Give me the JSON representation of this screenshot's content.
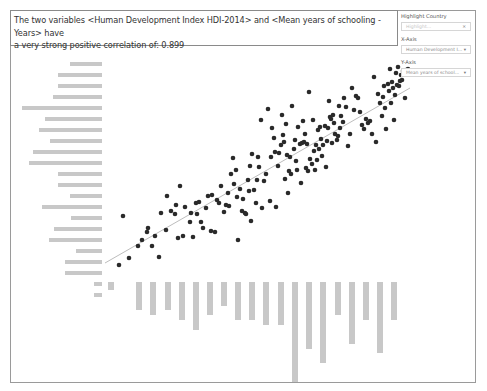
{
  "title": {
    "line1": "The two variables <Human Development Index HDI-2014> and <Mean years of schooling - Years> have",
    "line2": "a very strong positive correlation of: 0.899"
  },
  "controls": {
    "highlight": {
      "label": "Highlight Country",
      "placeholder": "Highlight..."
    },
    "x_axis": {
      "label": "X-Axis",
      "value": "Human Development I...",
      "arrow": "▾"
    },
    "y_axis": {
      "label": "Y-Axis",
      "value": "Mean years of school...",
      "arrow": "▾"
    }
  },
  "colors": {
    "dot": "#2a2a2a",
    "trend": "#bdbdbd",
    "hist": "#c8c8c8",
    "frame": "#9a9a9a"
  },
  "chart_data": {
    "type": "scatter",
    "title": "The two variables <Human Development Index HDI-2014> and <Mean years of schooling - Years> have a very strong positive correlation of: 0.899",
    "xlabel": "Human Development Index HDI-2014",
    "ylabel": "Mean years of schooling - Years",
    "correlation": 0.899,
    "grid": false,
    "trend_line": {
      "x1": 105,
      "y1": 263,
      "x2": 410,
      "y2": 88
    },
    "points_px": [
      [
        119,
        265
      ],
      [
        123,
        216
      ],
      [
        129,
        258
      ],
      [
        138,
        246
      ],
      [
        142,
        240
      ],
      [
        147,
        232
      ],
      [
        148,
        228
      ],
      [
        152,
        246
      ],
      [
        155,
        236
      ],
      [
        159,
        257
      ],
      [
        161,
        213
      ],
      [
        166,
        230
      ],
      [
        167,
        196
      ],
      [
        171,
        211
      ],
      [
        175,
        214
      ],
      [
        176,
        205
      ],
      [
        178,
        238
      ],
      [
        180,
        186
      ],
      [
        183,
        236
      ],
      [
        185,
        207
      ],
      [
        190,
        222
      ],
      [
        191,
        213
      ],
      [
        193,
        237
      ],
      [
        196,
        203
      ],
      [
        197,
        214
      ],
      [
        199,
        202
      ],
      [
        201,
        222
      ],
      [
        203,
        228
      ],
      [
        206,
        208
      ],
      [
        208,
        196
      ],
      [
        211,
        231
      ],
      [
        212,
        195
      ],
      [
        215,
        232
      ],
      [
        217,
        200
      ],
      [
        219,
        203
      ],
      [
        221,
        186
      ],
      [
        224,
        212
      ],
      [
        226,
        205
      ],
      [
        228,
        193
      ],
      [
        229,
        206
      ],
      [
        231,
        174
      ],
      [
        233,
        158
      ],
      [
        234,
        184
      ],
      [
        236,
        170
      ],
      [
        237,
        197
      ],
      [
        238,
        240
      ],
      [
        240,
        189
      ],
      [
        242,
        211
      ],
      [
        243,
        199
      ],
      [
        245,
        213
      ],
      [
        246,
        214
      ],
      [
        248,
        180
      ],
      [
        249,
        191
      ],
      [
        250,
        166
      ],
      [
        251,
        221
      ],
      [
        252,
        154
      ],
      [
        254,
        190
      ],
      [
        256,
        203
      ],
      [
        257,
        180
      ],
      [
        258,
        157
      ],
      [
        259,
        167
      ],
      [
        261,
        120
      ],
      [
        262,
        208
      ],
      [
        264,
        181
      ],
      [
        266,
        174
      ],
      [
        268,
        109
      ],
      [
        270,
        201
      ],
      [
        271,
        157
      ],
      [
        272,
        128
      ],
      [
        274,
        138
      ],
      [
        275,
        152
      ],
      [
        276,
        207
      ],
      [
        278,
        166
      ],
      [
        279,
        153
      ],
      [
        281,
        145
      ],
      [
        282,
        115
      ],
      [
        283,
        135
      ],
      [
        284,
        142
      ],
      [
        285,
        179
      ],
      [
        286,
        124
      ],
      [
        287,
        155
      ],
      [
        288,
        193
      ],
      [
        289,
        171
      ],
      [
        290,
        157
      ],
      [
        291,
        174
      ],
      [
        292,
        106
      ],
      [
        294,
        149
      ],
      [
        295,
        140
      ],
      [
        296,
        161
      ],
      [
        297,
        170
      ],
      [
        298,
        127
      ],
      [
        300,
        144
      ],
      [
        301,
        183
      ],
      [
        302,
        143
      ],
      [
        303,
        121
      ],
      [
        304,
        142
      ],
      [
        305,
        134
      ],
      [
        306,
        168
      ],
      [
        307,
        144
      ],
      [
        308,
        171
      ],
      [
        309,
        92
      ],
      [
        310,
        159
      ],
      [
        312,
        164
      ],
      [
        313,
        120
      ],
      [
        314,
        151
      ],
      [
        315,
        170
      ],
      [
        316,
        145
      ],
      [
        317,
        160
      ],
      [
        318,
        130
      ],
      [
        319,
        149
      ],
      [
        320,
        127
      ],
      [
        321,
        139
      ],
      [
        322,
        156
      ],
      [
        323,
        145
      ],
      [
        325,
        126
      ],
      [
        326,
        167
      ],
      [
        327,
        141
      ],
      [
        328,
        128
      ],
      [
        329,
        101
      ],
      [
        330,
        117
      ],
      [
        331,
        119
      ],
      [
        332,
        143
      ],
      [
        333,
        115
      ],
      [
        334,
        123
      ],
      [
        335,
        134
      ],
      [
        337,
        140
      ],
      [
        338,
        136
      ],
      [
        339,
        106
      ],
      [
        340,
        128
      ],
      [
        341,
        116
      ],
      [
        343,
        122
      ],
      [
        344,
        98
      ],
      [
        346,
        107
      ],
      [
        348,
        146
      ],
      [
        350,
        134
      ],
      [
        352,
        88
      ],
      [
        354,
        110
      ],
      [
        356,
        96
      ],
      [
        358,
        98
      ],
      [
        360,
        112
      ],
      [
        362,
        125
      ],
      [
        364,
        129
      ],
      [
        366,
        119
      ],
      [
        368,
        123
      ],
      [
        370,
        121
      ],
      [
        372,
        134
      ],
      [
        374,
        77
      ],
      [
        376,
        142
      ],
      [
        378,
        94
      ],
      [
        380,
        103
      ],
      [
        382,
        116
      ],
      [
        383,
        97
      ],
      [
        384,
        86
      ],
      [
        385,
        108
      ],
      [
        386,
        129
      ],
      [
        388,
        84
      ],
      [
        389,
        91
      ],
      [
        390,
        69
      ],
      [
        391,
        103
      ],
      [
        392,
        82
      ],
      [
        393,
        88
      ],
      [
        394,
        120
      ],
      [
        395,
        95
      ],
      [
        396,
        73
      ],
      [
        397,
        85
      ],
      [
        398,
        67
      ],
      [
        399,
        86
      ],
      [
        400,
        81
      ],
      [
        401,
        75
      ],
      [
        402,
        80
      ],
      [
        403,
        71
      ],
      [
        405,
        98
      ],
      [
        406,
        70
      ],
      [
        408,
        69
      ],
      [
        410,
        74
      ]
    ],
    "y_marginal_hist": {
      "orientation": "horizontal",
      "bars": [
        {
          "y": 64,
          "width": 32
        },
        {
          "y": 75,
          "width": 44
        },
        {
          "y": 86,
          "width": 44
        },
        {
          "y": 97,
          "width": 49
        },
        {
          "y": 108,
          "width": 80
        },
        {
          "y": 119,
          "width": 57
        },
        {
          "y": 130,
          "width": 63
        },
        {
          "y": 141,
          "width": 52
        },
        {
          "y": 152,
          "width": 69
        },
        {
          "y": 163,
          "width": 73
        },
        {
          "y": 174,
          "width": 44
        },
        {
          "y": 185,
          "width": 44
        },
        {
          "y": 196,
          "width": 32
        },
        {
          "y": 207,
          "width": 60
        },
        {
          "y": 218,
          "width": 31
        },
        {
          "y": 229,
          "width": 48
        },
        {
          "y": 240,
          "width": 53
        },
        {
          "y": 251,
          "width": 26
        },
        {
          "y": 262,
          "width": 37
        },
        {
          "y": 273,
          "width": 37
        },
        {
          "y": 284,
          "width": 8
        },
        {
          "y": 295,
          "width": 8
        }
      ]
    },
    "x_marginal_hist": {
      "orientation": "vertical",
      "bars": [
        {
          "x": 108,
          "height": 8
        },
        {
          "x": 136,
          "height": 28
        },
        {
          "x": 150,
          "height": 33
        },
        {
          "x": 165,
          "height": 28
        },
        {
          "x": 179,
          "height": 38
        },
        {
          "x": 193,
          "height": 48
        },
        {
          "x": 207,
          "height": 33
        },
        {
          "x": 221,
          "height": 24
        },
        {
          "x": 235,
          "height": 38
        },
        {
          "x": 249,
          "height": 38
        },
        {
          "x": 263,
          "height": 43
        },
        {
          "x": 278,
          "height": 43
        },
        {
          "x": 292,
          "height": 100
        },
        {
          "x": 306,
          "height": 67
        },
        {
          "x": 320,
          "height": 81
        },
        {
          "x": 335,
          "height": 33
        },
        {
          "x": 349,
          "height": 62
        },
        {
          "x": 363,
          "height": 38
        },
        {
          "x": 377,
          "height": 71
        },
        {
          "x": 391,
          "height": 38
        }
      ]
    }
  }
}
